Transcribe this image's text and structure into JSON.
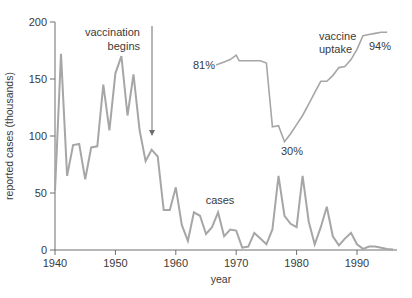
{
  "chart_data": {
    "type": "line",
    "title": "",
    "xlabel": "year",
    "ylabel": "reported cases (thousands)",
    "xlim": [
      1940,
      1997
    ],
    "ylim": [
      0,
      200
    ],
    "xticks": [
      1940,
      1950,
      1960,
      1970,
      1980,
      1990
    ],
    "yticks": [
      0,
      50,
      100,
      150,
      200
    ],
    "grid": false,
    "legend": null,
    "series": [
      {
        "name": "cases",
        "x": [
          1940,
          1941,
          1942,
          1943,
          1944,
          1945,
          1946,
          1947,
          1948,
          1949,
          1950,
          1951,
          1952,
          1953,
          1954,
          1955,
          1956,
          1957,
          1958,
          1959,
          1960,
          1961,
          1962,
          1963,
          1964,
          1965,
          1966,
          1967,
          1968,
          1969,
          1970,
          1971,
          1972,
          1973,
          1974,
          1975,
          1976,
          1977,
          1978,
          1979,
          1980,
          1981,
          1982,
          1983,
          1984,
          1985,
          1986,
          1987,
          1988,
          1989,
          1990,
          1991,
          1992,
          1993,
          1994,
          1995,
          1996
        ],
        "values": [
          52,
          172,
          65,
          92,
          93,
          62,
          90,
          91,
          145,
          105,
          155,
          170,
          118,
          154,
          105,
          78,
          88,
          82,
          35,
          35,
          55,
          22,
          8,
          33,
          30,
          14,
          20,
          33,
          12,
          18,
          17,
          2,
          3,
          15,
          10,
          5,
          18,
          65,
          30,
          23,
          20,
          65,
          25,
          5,
          20,
          38,
          12,
          4,
          10,
          15,
          5,
          1,
          3,
          3,
          2,
          1,
          0.5
        ]
      },
      {
        "name": "vaccine uptake",
        "note": "plotted on same vertical pixel scale; annotated with percentages",
        "x": [
          1967,
          1968,
          1969,
          1970,
          1970.5,
          1971,
          1972,
          1973,
          1974,
          1975,
          1976,
          1977,
          1978,
          1979,
          1980,
          1981,
          1982,
          1983,
          1984,
          1985,
          1986,
          1987,
          1988,
          1989,
          1990,
          1991,
          1992,
          1993,
          1994,
          1995
        ],
        "values": [
          163,
          165,
          167,
          171,
          166,
          166,
          166,
          166,
          166,
          164,
          108,
          109,
          95,
          102,
          110,
          118,
          128,
          138,
          148,
          148,
          153,
          160,
          161,
          167,
          176,
          188,
          189,
          190,
          191,
          191
        ],
        "percent_labels": [
          {
            "year": 1967,
            "label": "81%"
          },
          {
            "year": 1978,
            "label": "30%"
          },
          {
            "year": 1995,
            "label": "94%"
          }
        ]
      }
    ],
    "annotations": [
      {
        "text": "vaccination begins",
        "x": 1956,
        "arrow": true
      },
      {
        "text": "cases",
        "x": 1966
      },
      {
        "text": "vaccine uptake",
        "x": 1986
      },
      {
        "text": "81%",
        "x": 1965
      },
      {
        "text": "30%",
        "x": 1978
      },
      {
        "text": "94%",
        "x": 1993
      }
    ],
    "colors": {
      "line": "#a6a6a6",
      "axis": "#6e6e6e",
      "text": "#3a3a3a",
      "background": "#ffffff"
    }
  },
  "labels": {
    "ylabel": "reported cases (thousands)",
    "xlabel": "year",
    "vaccination_line1": "vaccination",
    "vaccination_line2": "begins",
    "cases": "cases",
    "uptake_line1": "vaccine",
    "uptake_line2": "uptake",
    "pct_start": "81%",
    "pct_min": "30%",
    "pct_end": "94%"
  }
}
